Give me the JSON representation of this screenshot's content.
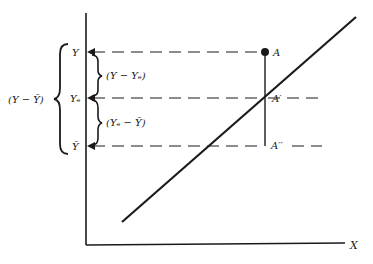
{
  "diagram": {
    "type": "regression-deviation-decomposition",
    "axes": {
      "x_label": "X"
    },
    "levels": {
      "y": "Y",
      "y_est": "Yₑ",
      "y_bar": "Ȳ"
    },
    "points": {
      "a": "A",
      "a_prime": "A′",
      "a_double_prime": "A′′"
    },
    "braces": {
      "total": "(Y − Ȳ)",
      "unexplained": "(Y − Yₑ)",
      "explained": "(Yₑ − Ȳ)"
    },
    "colors": {
      "ink": "#1a1a1a",
      "background": "#ffffff"
    }
  }
}
